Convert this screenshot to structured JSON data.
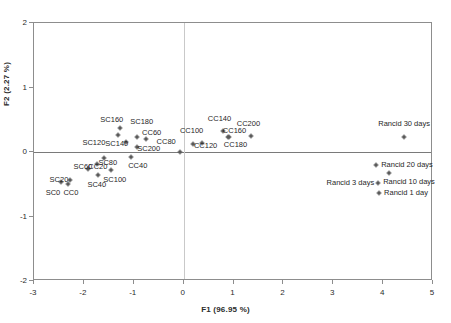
{
  "chart_data": {
    "type": "scatter",
    "title": "",
    "xlabel": "F1 (96.95 %)",
    "ylabel": "F2 (2.27 %)",
    "xlim": [
      -3,
      5
    ],
    "ylim": [
      -2,
      2
    ],
    "xticks": [
      "-3",
      "-2",
      "-1",
      "0",
      "1",
      "2",
      "3",
      "4",
      "5"
    ],
    "xtick_values": [
      -3,
      -2,
      -1,
      0,
      1,
      2,
      3,
      4,
      5
    ],
    "yticks": [
      "2",
      "1",
      "0",
      "-1",
      "-2"
    ],
    "ytick_values": [
      2,
      1,
      0,
      -1,
      -2
    ],
    "grid": false,
    "legend": "none",
    "zero_lines": true,
    "points": [
      {
        "label": "SC0",
        "x": -2.46,
        "y": -0.47,
        "lx": -2.62,
        "ly": -0.63,
        "anchor": "mid"
      },
      {
        "label": "CC0",
        "x": -2.32,
        "y": -0.5,
        "lx": -2.26,
        "ly": -0.63,
        "anchor": "mid"
      },
      {
        "label": "SC20",
        "x": -2.28,
        "y": -0.43,
        "lx": -2.5,
        "ly": -0.44,
        "anchor": "mid"
      },
      {
        "label": "SC40",
        "x": -1.72,
        "y": -0.35,
        "lx": -1.74,
        "ly": -0.51,
        "anchor": "mid"
      },
      {
        "label": "SC60",
        "x": -1.92,
        "y": -0.27,
        "lx": -2.02,
        "ly": -0.23,
        "anchor": "mid"
      },
      {
        "label": "CC20",
        "x": -1.74,
        "y": -0.18,
        "lx": -1.72,
        "ly": -0.24,
        "anchor": "mid"
      },
      {
        "label": "SC80",
        "x": -1.6,
        "y": -0.1,
        "lx": -1.52,
        "ly": -0.17,
        "anchor": "mid"
      },
      {
        "label": "SC100",
        "x": -1.46,
        "y": -0.28,
        "lx": -1.38,
        "ly": -0.44,
        "anchor": "mid"
      },
      {
        "label": "SC120",
        "x": -1.32,
        "y": 0.27,
        "lx": -1.8,
        "ly": 0.14,
        "anchor": "mid"
      },
      {
        "label": "SC140",
        "x": -1.15,
        "y": 0.15,
        "lx": -1.34,
        "ly": 0.13,
        "anchor": "mid"
      },
      {
        "label": "SC160",
        "x": -1.28,
        "y": 0.37,
        "lx": -1.44,
        "ly": 0.5,
        "anchor": "mid"
      },
      {
        "label": "CC40",
        "x": -1.06,
        "y": -0.07,
        "lx": -0.92,
        "ly": -0.22,
        "anchor": "mid"
      },
      {
        "label": "SC180",
        "x": -0.93,
        "y": 0.23,
        "lx": -0.84,
        "ly": 0.47,
        "anchor": "mid"
      },
      {
        "label": "SC200",
        "x": -0.94,
        "y": 0.07,
        "lx": -0.7,
        "ly": 0.05,
        "anchor": "mid"
      },
      {
        "label": "CC60",
        "x": -0.76,
        "y": 0.2,
        "lx": -0.64,
        "ly": 0.29,
        "anchor": "mid"
      },
      {
        "label": "CC80",
        "x": -0.08,
        "y": 0.0,
        "lx": -0.35,
        "ly": 0.15,
        "anchor": "mid"
      },
      {
        "label": "CC100",
        "x": 0.18,
        "y": 0.12,
        "lx": 0.16,
        "ly": 0.33,
        "anchor": "mid"
      },
      {
        "label": "CC120",
        "x": 0.36,
        "y": 0.14,
        "lx": 0.44,
        "ly": 0.09,
        "anchor": "mid"
      },
      {
        "label": "CC140",
        "x": 0.78,
        "y": 0.32,
        "lx": 0.72,
        "ly": 0.51,
        "anchor": "mid"
      },
      {
        "label": "CC160",
        "x": 0.88,
        "y": 0.23,
        "lx": 1.02,
        "ly": 0.33,
        "anchor": "mid"
      },
      {
        "label": "CC180",
        "x": 0.9,
        "y": 0.23,
        "lx": 1.04,
        "ly": 0.11,
        "anchor": "mid"
      },
      {
        "label": "CC200",
        "x": 1.36,
        "y": 0.25,
        "lx": 1.3,
        "ly": 0.43,
        "anchor": "mid"
      },
      {
        "label": "Rancid 30 days",
        "x": 4.42,
        "y": 0.23,
        "lx": 4.42,
        "ly": 0.44,
        "anchor": "mid"
      },
      {
        "label": "Rancid 20 days",
        "x": 3.86,
        "y": -0.2,
        "lx": 3.96,
        "ly": -0.2,
        "anchor": "start"
      },
      {
        "label": "Rancid 10 days",
        "x": 4.12,
        "y": -0.33,
        "lx": 4.0,
        "ly": -0.47,
        "anchor": "start"
      },
      {
        "label": "Rancid 3 days",
        "x": 3.9,
        "y": -0.48,
        "lx": 3.82,
        "ly": -0.48,
        "anchor": "end"
      },
      {
        "label": "Rancid 1 day",
        "x": 3.92,
        "y": -0.63,
        "lx": 4.02,
        "ly": -0.63,
        "anchor": "start"
      }
    ]
  },
  "colors": {
    "point": "#5a5a5a",
    "frame": "#8d8d8d",
    "zero_line": "#7a7a7a",
    "text": "#1f1f1f",
    "background": "#ffffff"
  }
}
